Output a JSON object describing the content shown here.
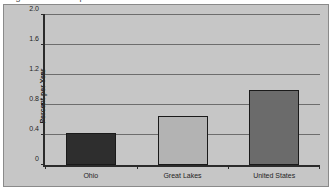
{
  "figure": {
    "title_sliver": "Figure 3. Percent per Year",
    "background_color": "#c6c6c6",
    "page_background": "#ffffff",
    "border_color": "#8a8a8a",
    "axis_color": "#2b2b2b",
    "gridline_color": "#6d6d6d"
  },
  "chart_data": {
    "type": "bar",
    "title": "",
    "xlabel": "",
    "ylabel": "Percent per Year",
    "categories": [
      "Ohio",
      "Great Lakes",
      "United States"
    ],
    "values": [
      0.43,
      0.65,
      1.0
    ],
    "colors": [
      "#2e2e2e",
      "#b3b3b3",
      "#6b6b6b"
    ],
    "ylim": [
      0,
      2.0
    ],
    "ytick_labels": [
      "0",
      "0.4",
      "0.8",
      "1.2",
      "1.6",
      "2.0"
    ],
    "ytick_values": [
      0,
      0.4,
      0.8,
      1.2,
      1.6,
      2.0
    ],
    "grid": true,
    "legend": false,
    "legend_position": "none"
  }
}
